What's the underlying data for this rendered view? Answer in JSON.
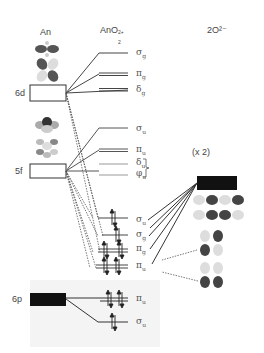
{
  "headers": {
    "metal": "An",
    "complex_main": "AnO",
    "complex_sub": "2",
    "complex_sup": "2+",
    "ligand": "2O²⁻"
  },
  "atomic_orbitals": [
    {
      "label": "6d",
      "style": "open"
    },
    {
      "label": "5f",
      "style": "open"
    },
    {
      "label": "6p",
      "style": "filled"
    }
  ],
  "ligand_group": {
    "multiplier": "(x 2)"
  },
  "mo_levels": [
    {
      "sym": "σ",
      "sub": "g",
      "group": "6d"
    },
    {
      "sym": "π",
      "sub": "g",
      "group": "6d"
    },
    {
      "sym": "δ",
      "sub": "g",
      "group": "6d"
    },
    {
      "sym": "σ",
      "sub": "u",
      "group": "5f"
    },
    {
      "sym": "π",
      "sub": "u",
      "group": "5f"
    },
    {
      "sym": "δ",
      "sub": "u",
      "group": "5f"
    },
    {
      "sym": "φ",
      "sub": "u",
      "group": "5f"
    },
    {
      "sym": "σ",
      "sub": "u",
      "group": "bonding",
      "electrons": 2
    },
    {
      "sym": "σ",
      "sub": "g",
      "group": "bonding",
      "electrons": 2
    },
    {
      "sym": "π",
      "sub": "g",
      "group": "bonding",
      "electrons": 4
    },
    {
      "sym": "π",
      "sub": "u",
      "group": "bonding",
      "electrons": 4
    },
    {
      "sym": "π",
      "sub": "u",
      "group": "6p",
      "electrons": 4
    },
    {
      "sym": "σ",
      "sub": "u",
      "group": "6p",
      "electrons": 2
    }
  ]
}
